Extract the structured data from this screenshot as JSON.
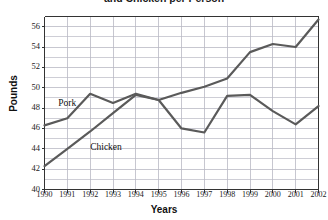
{
  "chart_data": {
    "type": "line",
    "title": "and Chicken per Person",
    "xlabel": "Years",
    "ylabel": "Pounds",
    "x": [
      1990,
      1991,
      1992,
      1993,
      1994,
      1995,
      1996,
      1997,
      1998,
      1999,
      2000,
      2001,
      2002
    ],
    "xtick_labels": [
      "1990",
      "1991",
      "1992",
      "1993",
      "1994",
      "1995",
      "1996",
      "1997",
      "1998",
      "1999",
      "2000",
      "2001",
      "2002"
    ],
    "ytick_labels": [
      "40",
      "42",
      "44",
      "46",
      "48",
      "50",
      "52",
      "54",
      "56"
    ],
    "ytick_values": [
      40,
      42,
      44,
      46,
      48,
      50,
      52,
      54,
      56
    ],
    "ylim": [
      40,
      57
    ],
    "xlim": [
      1990,
      2002
    ],
    "grid": true,
    "legend": "inline-labels",
    "line_color": "#5a5a5a",
    "grid_color": "#b9b9c4",
    "axis_color": "#333333",
    "series": [
      {
        "name": "Pork",
        "label_x": 1990.6,
        "label_y": 48.4,
        "values": [
          46.3,
          47.0,
          49.4,
          48.5,
          49.4,
          48.8,
          46.0,
          45.6,
          49.2,
          49.3,
          47.7,
          46.4,
          48.2
        ]
      },
      {
        "name": "Chicken",
        "label_x": 1992.0,
        "label_y": 44.1,
        "values": [
          42.3,
          44.0,
          45.7,
          47.5,
          49.3,
          48.8,
          49.5,
          50.1,
          50.9,
          53.5,
          54.3,
          54.0,
          56.7
        ]
      }
    ]
  }
}
